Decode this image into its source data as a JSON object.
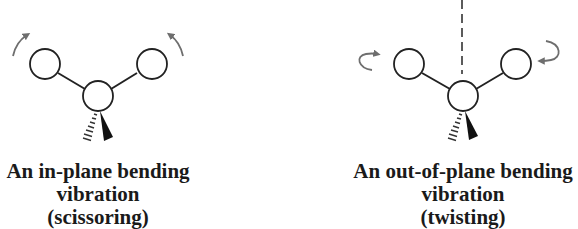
{
  "panels": [
    {
      "id": "scissoring",
      "caption": {
        "line1": "An in-plane bending",
        "line2": "vibration",
        "line3": "(scissoring)"
      },
      "arrows": [
        "curved-arrow-up-left",
        "curved-arrow-up-right"
      ],
      "has_axis_line": false
    },
    {
      "id": "twisting",
      "caption": {
        "line1": "An out-of-plane bending",
        "line2": "vibration",
        "line3": "(twisting)"
      },
      "arrows": [
        "curved-arrow-rotate-left",
        "curved-arrow-rotate-right"
      ],
      "has_axis_line": true
    }
  ],
  "colors": {
    "stroke": "#222222",
    "arrow": "#6e6e6e",
    "text": "#1a1a1a",
    "background": "#ffffff"
  }
}
